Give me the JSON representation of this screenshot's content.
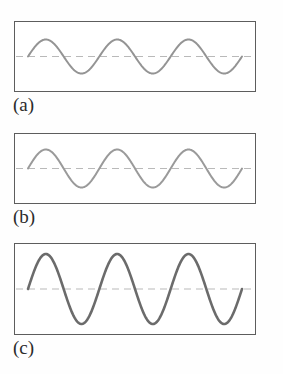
{
  "figure": {
    "background_color": "#fefefe",
    "frame_color": "#5d5d5d",
    "axis_line_color": "#b9b9b9",
    "panels": [
      {
        "id": "a",
        "label": "(a)",
        "wave_color": "#949494",
        "wave_width": 2.0,
        "amplitude_px": 17,
        "cycles": 3,
        "phase": "sine",
        "box": {
          "x": 14,
          "y": 21,
          "width": 242,
          "height": 71
        },
        "axis_dashed": true
      },
      {
        "id": "b",
        "label": "(b)",
        "wave_color": "#9a9a9a",
        "wave_width": 2.0,
        "amplitude_px": 19,
        "cycles": 3,
        "phase": "sine",
        "box": {
          "x": 14,
          "y": 133,
          "width": 242,
          "height": 71
        },
        "axis_dashed": true
      },
      {
        "id": "c",
        "label": "(c)",
        "wave_color": "#6b6b6b",
        "wave_width": 2.6,
        "amplitude_px": 35,
        "cycles": 3,
        "phase": "sine",
        "box": {
          "x": 14,
          "y": 243,
          "width": 242,
          "height": 92
        },
        "axis_dashed": true
      }
    ]
  },
  "chart_data": {
    "type": "line",
    "title": "",
    "xlabel": "",
    "ylabel": "",
    "x": [
      0,
      0.0625,
      0.125,
      0.1875,
      0.25,
      0.3125,
      0.375,
      0.4375,
      0.5,
      0.5625,
      0.625,
      0.6875,
      0.75,
      0.8125,
      0.875,
      0.9375,
      1
    ],
    "xlim": [
      0,
      1
    ],
    "grid": false,
    "legend": null,
    "series": [
      {
        "name": "(a)",
        "amplitude": 17,
        "cycles": 3,
        "ylim": [
          -35,
          35
        ],
        "values": [
          0,
          0.924,
          0.707,
          -0.383,
          -1,
          -0.383,
          0.707,
          0.924,
          0,
          -0.924,
          -0.707,
          0.383,
          1,
          0.383,
          -0.707,
          -0.924,
          0
        ]
      },
      {
        "name": "(b)",
        "amplitude": 19,
        "cycles": 3,
        "ylim": [
          -35,
          35
        ],
        "values": [
          0,
          0.924,
          0.707,
          -0.383,
          -1,
          -0.383,
          0.707,
          0.924,
          0,
          -0.924,
          -0.707,
          0.383,
          1,
          0.383,
          -0.707,
          -0.924,
          0
        ]
      },
      {
        "name": "(c)",
        "amplitude": 35,
        "cycles": 3,
        "ylim": [
          -46,
          46
        ],
        "values": [
          0,
          0.924,
          0.707,
          -0.383,
          -1,
          -0.383,
          0.707,
          0.924,
          0,
          -0.924,
          -0.707,
          0.383,
          1,
          0.383,
          -0.707,
          -0.924,
          0
        ]
      }
    ]
  }
}
